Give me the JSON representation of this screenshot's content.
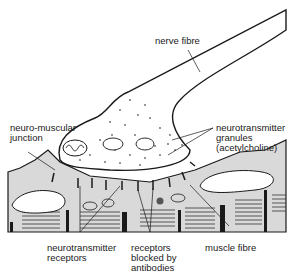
{
  "diagram": {
    "labels": {
      "nerve_fibre": "nerve fibre",
      "nmj_line1": "neuro-muscular",
      "nmj_line2": "junction",
      "granules_line1": "neurotransmitter",
      "granules_line2": "granules",
      "granules_line3": "(acetylcholine)",
      "receptors_line1": "neurotransmitter",
      "receptors_line2": "receptors",
      "blocked_line1": "receptors",
      "blocked_line2": "blocked by",
      "blocked_line3": "antibodies",
      "muscle_fibre": "muscle fibre"
    },
    "colors": {
      "ink": "#1a1a1a",
      "muscle_fill": "#d9d9d9",
      "nerve_fill": "#ffffff",
      "background": "#ffffff"
    }
  }
}
